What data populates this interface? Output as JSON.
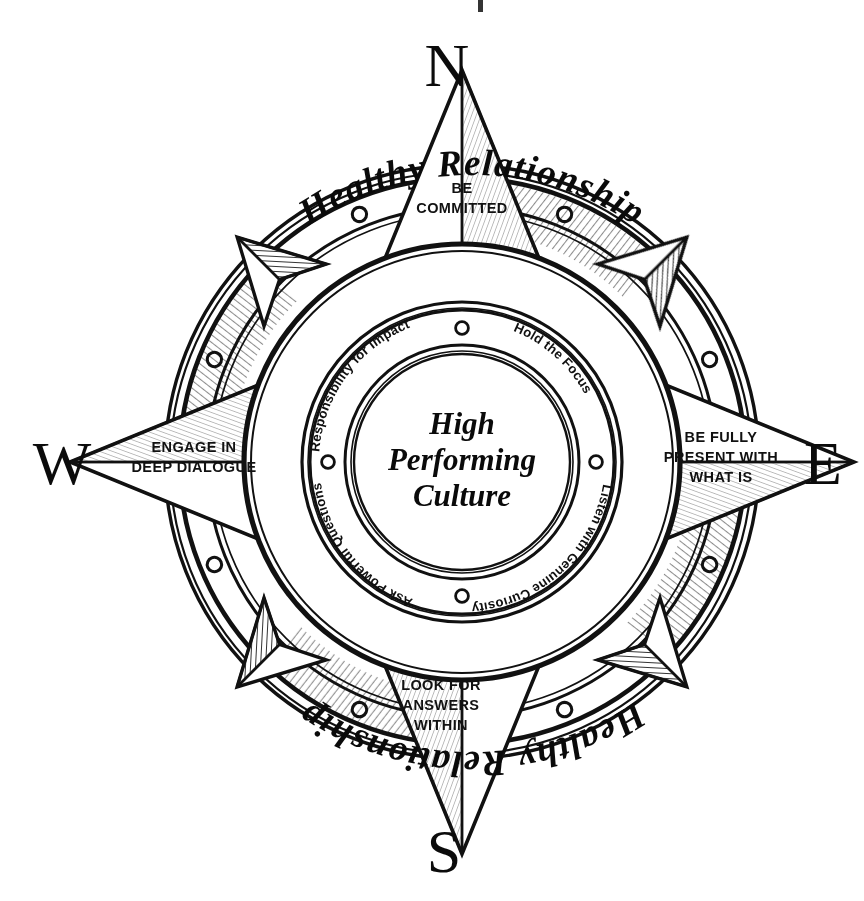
{
  "figure": {
    "style": "hand-drawn ink illustration",
    "background_color": "#ffffff",
    "ink_color": "#111111"
  },
  "cardinals": {
    "north": "N",
    "east": "E",
    "south": "S",
    "west": "W"
  },
  "compass_points": [
    {
      "direction": "north",
      "lines": [
        "BE",
        "COMMITTED"
      ]
    },
    {
      "direction": "east",
      "lines": [
        "BE FULLY",
        "PRESENT WITH",
        "WHAT IS"
      ]
    },
    {
      "direction": "south",
      "lines": [
        "LOOK FOR",
        "ANSWERS",
        "WITHIN"
      ]
    },
    {
      "direction": "west",
      "lines": [
        "ENGAGE IN",
        "DEEP DIALOGUE"
      ]
    }
  ],
  "outer_ring": {
    "top_label": "Healthy Relationship",
    "bottom_label": "Healthy Relationship"
  },
  "inner_ring": {
    "labels": [
      "Responsibility for Impact",
      "Hold the Focus",
      "Listen with Genuine Curiosity",
      "Ask Powerful Questions"
    ]
  },
  "center": {
    "lines": [
      "High",
      "Performing",
      "Culture"
    ]
  },
  "ring_rivets": {
    "count": 8,
    "shape": "small-open-circle"
  }
}
